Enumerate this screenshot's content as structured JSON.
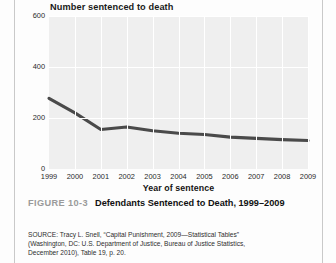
{
  "chart_data": {
    "type": "line",
    "title": "Number sentenced to death",
    "xlabel": "Year of sentence",
    "ylabel": "",
    "categories": [
      "1999",
      "2000",
      "2001",
      "2002",
      "2003",
      "2004",
      "2005",
      "2006",
      "2007",
      "2008",
      "2009"
    ],
    "values": [
      277,
      220,
      155,
      165,
      150,
      140,
      135,
      125,
      120,
      115,
      112
    ],
    "yticks": [
      "0",
      "200",
      "400",
      "600"
    ],
    "ytick_values": [
      0,
      200,
      400,
      600
    ],
    "ylim": [
      0,
      600
    ],
    "grid": true,
    "legend": "none",
    "series_color": "#4a4a4a",
    "plot_background": "#efefef",
    "gridline_color": "#ffffff"
  },
  "caption": {
    "figure_number": "FIGURE 10-3",
    "text": "Defendants Sentenced to Death, 1999–2009"
  },
  "source_note": {
    "lines": [
      "SOURCE: Tracy L. Snell, “Capital Punishment, 2009—Statistical Tables”",
      "(Washington, DC: U.S. Department of Justice, Bureau of Justice Statistics,",
      "December 2010), Table 19, p. 20."
    ]
  }
}
